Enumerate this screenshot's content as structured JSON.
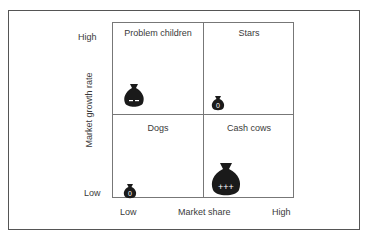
{
  "diagram": {
    "type": "bcg-matrix",
    "y_axis": {
      "label": "Market growth rate",
      "high": "High",
      "low": "Low"
    },
    "x_axis": {
      "label": "Market share",
      "low": "Low",
      "high": "High"
    },
    "quadrants": [
      {
        "name": "Problem children",
        "position": "top-left",
        "bag_size": "medium",
        "bag_mark": "– –"
      },
      {
        "name": "Stars",
        "position": "top-right",
        "bag_size": "small",
        "bag_mark": "0"
      },
      {
        "name": "Dogs",
        "position": "bottom-left",
        "bag_size": "small",
        "bag_mark": "0"
      },
      {
        "name": "Cash cows",
        "position": "bottom-right",
        "bag_size": "large",
        "bag_mark": "+++"
      }
    ]
  }
}
